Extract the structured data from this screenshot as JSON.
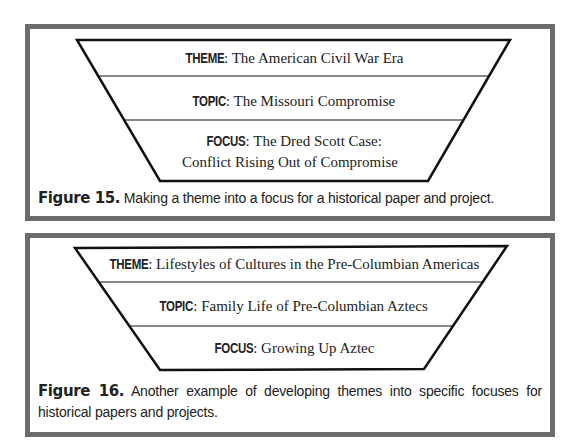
{
  "figures": [
    {
      "id": "fig15",
      "levels": [
        {
          "label": "THEME",
          "sep": ": ",
          "text": "The American Civil War Era"
        },
        {
          "label": "TOPIC",
          "sep": ": ",
          "text": "The Missouri Compromise"
        },
        {
          "label": "FOCUS",
          "sep": ": ",
          "text": "The Dred Scott Case:",
          "text2": "Conflict Rising Out of Compromise"
        }
      ],
      "caption": {
        "number": "Figure 15.",
        "text": " Making a theme into a focus for a historical paper and project."
      }
    },
    {
      "id": "fig16",
      "levels": [
        {
          "label": "THEME",
          "sep": ": ",
          "text": "Lifestyles of Cultures in the Pre-Columbian Americas"
        },
        {
          "label": "TOPIC",
          "sep": ": ",
          "text": "Family Life of Pre-Columbian Aztecs"
        },
        {
          "label": "FOCUS",
          "sep": ": ",
          "text": "Growing Up Aztec"
        }
      ],
      "caption": {
        "number": "Figure 16.",
        "text": " Another example of developing themes into specific focuses for historical papers and projects."
      }
    }
  ],
  "colors": {
    "frame_border": "#6b6b6b",
    "funnel_stroke": "#111111",
    "text": "#222222",
    "background": "#ffffff"
  }
}
